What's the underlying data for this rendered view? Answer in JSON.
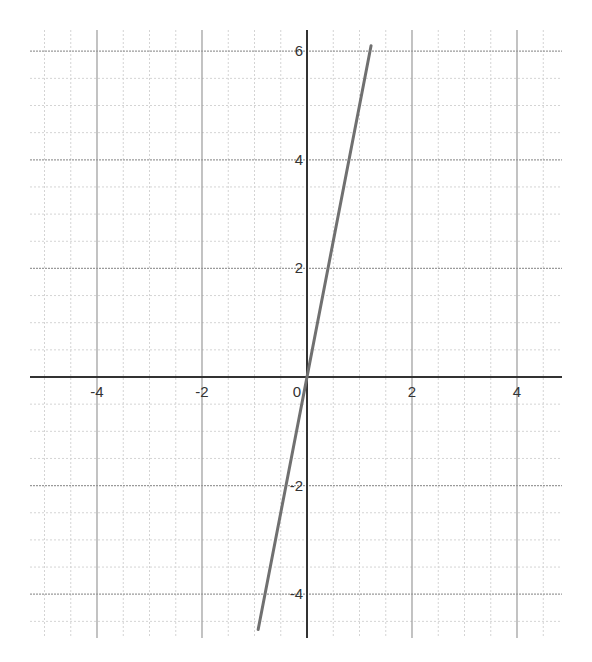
{
  "chart_data": {
    "type": "line",
    "title": "",
    "xlabel": "",
    "ylabel": "",
    "xlim": [
      -5.2,
      4.8
    ],
    "ylim": [
      -4.9,
      6.4
    ],
    "grid": true,
    "grid_minor_step": 0.5,
    "grid_major_step": 2,
    "x_ticks": [
      -4,
      -2,
      0,
      2,
      4
    ],
    "y_ticks": [
      -4,
      -2,
      2,
      4,
      6
    ],
    "x_tick_labels": [
      "-4",
      "-2",
      "0",
      "2",
      "4"
    ],
    "y_tick_labels": [
      "-4",
      "-2",
      "2",
      "4",
      "6"
    ],
    "series": [
      {
        "name": "y = 5x",
        "equation": "y = 5x",
        "x": [
          -0.93,
          1.22
        ],
        "y": [
          -4.65,
          6.1
        ],
        "color": "#707070"
      }
    ],
    "legend": null
  }
}
